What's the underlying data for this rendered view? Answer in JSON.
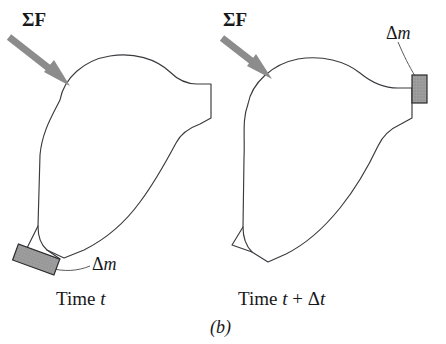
{
  "figure": {
    "panel_label": "(b)",
    "background_color": "#ffffff",
    "outline_color": "#3a3a3f",
    "arrow_color": "#8c8c8c",
    "block_fill_color": "#9e9e9e",
    "block_stroke_color": "#2b2b2e",
    "leader_color": "#5a5a5f"
  },
  "panels": [
    {
      "id": "time-t",
      "force_label": "ΣF",
      "mass_label_greek": "Δ",
      "mass_label_var": "m",
      "caption_prefix": "Time ",
      "caption_var": "t",
      "caption_suffix": ""
    },
    {
      "id": "time-t-plus-dt",
      "force_label": "ΣF",
      "mass_label_greek": "Δ",
      "mass_label_var": "m",
      "caption_prefix": "Time ",
      "caption_var": "t",
      "caption_plus": " + ",
      "caption_greek": "Δ",
      "caption_var2": "t"
    }
  ]
}
